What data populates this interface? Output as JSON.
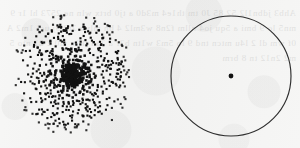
{
  "figure": {
    "title": "",
    "caption": "",
    "background_color": "#f4f4f3",
    "ink_color": "#121212",
    "panel_count": 2
  },
  "panels": [
    {
      "id": "scatter-panel",
      "name": "radial-dot-scatter",
      "type": "scatter",
      "label": "",
      "description": "Dense circular scatter of dots with strong central concentration",
      "center_x": 72,
      "center_y": 74,
      "radius": 61,
      "dot_color": "#121212",
      "dot_size": 2.1,
      "core_saturated": true
    },
    {
      "id": "circle-panel",
      "name": "circle-with-center-dot",
      "type": "outline",
      "label": "",
      "description": "Plain circle outline with a single dot marking the centre",
      "center_x": 81,
      "center_y": 76,
      "radius": 60,
      "stroke_color": "#2e2e2e",
      "stroke_width": 1.15,
      "center_dot_color": "#111111",
      "center_dot_radius": 2.4
    }
  ],
  "show_through_text": "Ahb3 jdbn1l2 52 85 J0 tm th1e4 m3d0 a tj0 brtx wln ne 2573 hl 1r 9mn5 lo 9 bmi a 5qu jo4 nllm f2n8 w3ml2 4 bn mlwr 2t0 9j ucl 1m2 A 0f wm dl 2 l4u mtcn tnd 9 lo 5m3 w1tn b2r a 2an th1a m0 2 32 nto 5m2 2n12 tn 8 brm",
  "chart_data": {
    "type": "scatter",
    "title": "",
    "xlabel": "",
    "ylabel": "",
    "grid": false,
    "legend": null,
    "xlim": [
      -61,
      61
    ],
    "ylim": [
      -61,
      61
    ],
    "radial_profile": {
      "description": "Surface density of points falls steeply with radius from a saturated core",
      "radius_bins": [
        0,
        6,
        12,
        18,
        24,
        30,
        36,
        42,
        48,
        54,
        61
      ],
      "counts_per_bin": [
        70,
        58,
        62,
        60,
        64,
        72,
        78,
        82,
        76,
        58
      ],
      "total_points": 680
    },
    "series": [
      {
        "name": "dots",
        "marker": "square-dot",
        "color": "#121212",
        "size": 2.1,
        "seed": 20250714,
        "distribution": "radially-decreasing-density",
        "center": [
          0,
          0
        ],
        "max_radius": 61
      }
    ]
  }
}
